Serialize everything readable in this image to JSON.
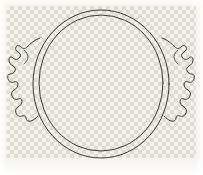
{
  "image": {
    "title": "Ceramic vessel rim line drawing",
    "subject": "two-handled circular bowl, plan view",
    "medium": "ink line art on transparent background",
    "width_px": 203,
    "height_px": 175
  },
  "background": {
    "type": "transparency-checkerboard",
    "cell_size_px": 4,
    "light_color": "#f2f1eb",
    "dark_color": "#d8d7d0",
    "paper_color": "#f3f2ec",
    "region": {
      "x": 6,
      "y": 6,
      "width": 190,
      "height": 152
    }
  },
  "ink": {
    "stroke_color": "#3b3a36",
    "soft_stroke_color": "#55544e",
    "stroke_width": 1
  },
  "shapes": {
    "outer_rim": {
      "name": "outer-rim-circle",
      "cx": 101,
      "cy": 84,
      "rx": 68,
      "ry": 74
    },
    "inner_rim": {
      "name": "inner-rim-circle",
      "cx": 101,
      "cy": 83,
      "rx": 62,
      "ry": 68
    },
    "left_handle": {
      "name": "left-handle",
      "extent_x": [
        8,
        42
      ],
      "extent_y": [
        38,
        122
      ]
    },
    "right_handle": {
      "name": "right-handle",
      "extent_x": [
        160,
        192
      ],
      "extent_y": [
        38,
        122
      ]
    }
  },
  "labels": {
    "caption": "",
    "scale": ""
  }
}
